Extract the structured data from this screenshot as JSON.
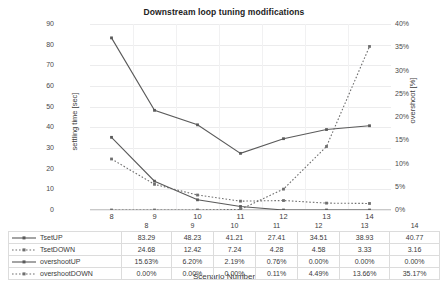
{
  "chart_data": {
    "type": "line",
    "title": "Downstream loop tuning modifications",
    "xlabel": "Scenario Number",
    "ylabel": "settling time [sec]",
    "ylabel_secondary": "overshoot [%]",
    "categories": [
      "8",
      "9",
      "10",
      "11",
      "12",
      "13",
      "14"
    ],
    "ylim": [
      0,
      90
    ],
    "yticks": [
      "0",
      "10",
      "20",
      "30",
      "40",
      "50",
      "60",
      "70",
      "80",
      "90"
    ],
    "ylim_secondary": [
      0,
      40
    ],
    "yticks_secondary": [
      "0%",
      "5%",
      "10%",
      "15%",
      "20%",
      "25%",
      "30%",
      "35%",
      "40%"
    ],
    "grid": true,
    "legend_position": "table-left",
    "series": [
      {
        "name": "TsetUP",
        "axis": "left",
        "style": "solid",
        "color": "#5a5a5a",
        "values": [
          83.29,
          48.23,
          41.21,
          27.41,
          34.51,
          38.93,
          40.77
        ],
        "labels": [
          "83.29",
          "48.23",
          "41.21",
          "27.41",
          "34.51",
          "38.93",
          "40.77"
        ]
      },
      {
        "name": "TsetDOWN",
        "axis": "left",
        "style": "dotted",
        "color": "#6e6e6e",
        "values": [
          24.68,
          12.42,
          7.24,
          4.28,
          4.58,
          3.33,
          3.16
        ],
        "labels": [
          "24.68",
          "12.42",
          "7.24",
          "4.28",
          "4.58",
          "3.33",
          "3.16"
        ]
      },
      {
        "name": "overshootUP",
        "axis": "right",
        "style": "solid",
        "color": "#5a5a5a",
        "values": [
          15.63,
          6.2,
          2.19,
          0.76,
          0.0,
          0.0,
          0.0
        ],
        "labels": [
          "15.63%",
          "6.20%",
          "2.19%",
          "0.76%",
          "0.00%",
          "0.00%",
          "0.00%"
        ]
      },
      {
        "name": "overshootDOWN",
        "axis": "right",
        "style": "dotted",
        "color": "#6e6e6e",
        "values": [
          0.0,
          0.0,
          0.0,
          0.11,
          4.49,
          13.66,
          35.17
        ],
        "labels": [
          "0.00%",
          "0.00%",
          "0.00%",
          "0.11%",
          "4.49%",
          "13.66%",
          "35.17%"
        ]
      }
    ]
  }
}
